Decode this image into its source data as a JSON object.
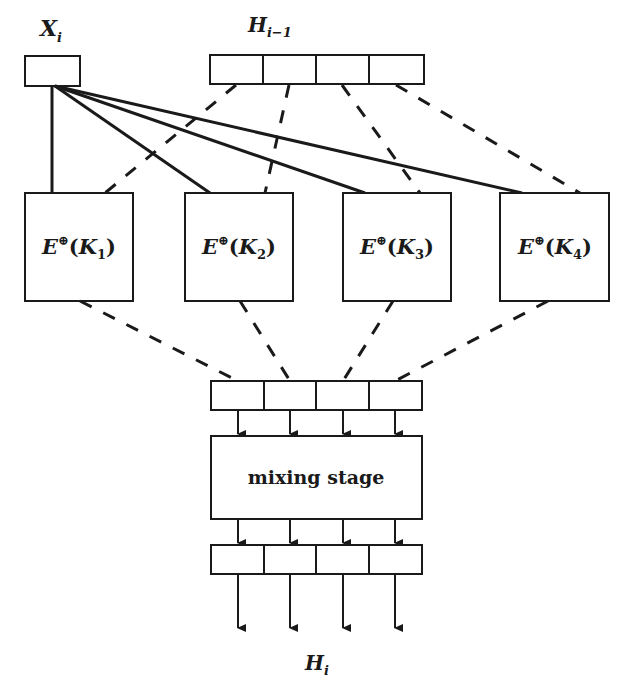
{
  "diagram": {
    "labels": {
      "input_x": "X",
      "input_x_sub": "i",
      "input_h": "H",
      "input_h_sub": "i−1",
      "output_h": "H",
      "output_h_sub": "i"
    },
    "encryptors": [
      {
        "func": "E",
        "sup": "⊕",
        "key": "K",
        "key_sub": "1"
      },
      {
        "func": "E",
        "sup": "⊕",
        "key": "K",
        "key_sub": "2"
      },
      {
        "func": "E",
        "sup": "⊕",
        "key": "K",
        "key_sub": "3"
      },
      {
        "func": "E",
        "sup": "⊕",
        "key": "K",
        "key_sub": "4"
      }
    ],
    "mixing_stage_label": "mixing stage",
    "register_cells": 4,
    "edges": {
      "x_to_encryptors": "solid",
      "h_prev_to_encryptors": "dashed",
      "encryptors_to_register": "dashed",
      "register_to_mixing": "arrow",
      "mixing_to_output_register": "arrow",
      "output_register_to_h": "arrow"
    }
  }
}
